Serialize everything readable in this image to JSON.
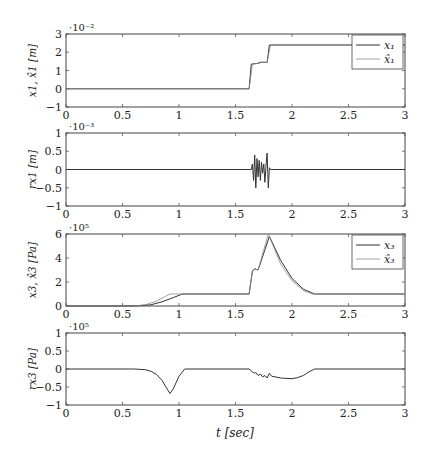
{
  "figure": {
    "xlabel": "t [sec]",
    "x_ticks": [
      "0",
      "0.5",
      "1",
      "1.5",
      "2",
      "2.5",
      "3"
    ],
    "colors": {
      "axis": "#444444",
      "series_dark": "#333333",
      "series_light": "#8a8a8a"
    }
  },
  "chart_data": [
    {
      "type": "line",
      "title": "",
      "ylabel": "x1, x̂1 [m]",
      "ylabel_main": "x",
      "ylabel_sub": "1",
      "ylabel_tail": ", x̂₁ [m]",
      "exponent": "·10⁻²",
      "xlim": [
        0,
        3
      ],
      "ylim": [
        -1,
        3
      ],
      "y_ticks": [
        "3",
        "2",
        "1",
        "0",
        "−1"
      ],
      "legend_position": "upper right",
      "series": [
        {
          "name": "x1",
          "legend": "x₁",
          "x": [
            0,
            1.62,
            1.64,
            1.71,
            1.71,
            1.78,
            1.8,
            3
          ],
          "values": [
            0,
            0,
            1.35,
            1.4,
            1.45,
            1.45,
            2.4,
            2.4
          ]
        },
        {
          "name": "x̂1",
          "legend": "x̂₁",
          "x": [
            0,
            1.62,
            1.65,
            1.71,
            1.72,
            1.78,
            1.81,
            3
          ],
          "values": [
            0,
            0,
            1.35,
            1.4,
            1.45,
            1.45,
            2.4,
            2.4
          ]
        }
      ]
    },
    {
      "type": "line",
      "title": "",
      "ylabel": "rx1 [m]",
      "exponent": "·10⁻³",
      "xlim": [
        0,
        3
      ],
      "ylim": [
        -1,
        1
      ],
      "y_ticks": [
        "1",
        "0.5",
        "0",
        "−0.5",
        "−1"
      ],
      "series": [
        {
          "name": "rx1",
          "x": [
            0,
            1.64,
            1.65,
            1.66,
            1.67,
            1.68,
            1.69,
            1.7,
            1.71,
            1.72,
            1.73,
            1.74,
            1.75,
            1.76,
            1.77,
            1.78,
            1.79,
            1.8,
            1.81,
            3
          ],
          "values": [
            0,
            0,
            0.15,
            -0.3,
            0.4,
            -0.5,
            0.3,
            -0.2,
            0.25,
            -0.3,
            0.2,
            -0.1,
            0.15,
            -0.35,
            0.1,
            0.45,
            -0.5,
            0.05,
            0,
            0
          ]
        }
      ]
    },
    {
      "type": "line",
      "title": "",
      "ylabel": "x3, x̂3 [Pa]",
      "exponent": "·10⁵",
      "xlim": [
        0,
        3
      ],
      "ylim": [
        0,
        6
      ],
      "y_ticks": [
        "6",
        "4",
        "2",
        "0"
      ],
      "legend_position": "upper right",
      "series": [
        {
          "name": "x3",
          "legend": "x₃",
          "x": [
            0,
            0.6,
            0.75,
            0.85,
            0.95,
            1.03,
            1.62,
            1.65,
            1.67,
            1.7,
            1.8,
            1.9,
            2.0,
            2.1,
            2.2,
            3
          ],
          "values": [
            0,
            0,
            0.1,
            0.35,
            0.7,
            1.0,
            1.0,
            2.9,
            3.1,
            3.0,
            5.8,
            3.8,
            2.3,
            1.4,
            1.0,
            1.0
          ]
        },
        {
          "name": "x̂3",
          "legend": "x̂₃",
          "x": [
            0,
            0.6,
            0.7,
            0.8,
            0.88,
            0.92,
            1.62,
            1.65,
            1.67,
            1.7,
            1.79,
            1.9,
            2.0,
            2.1,
            2.18,
            3
          ],
          "values": [
            0,
            0,
            0.1,
            0.4,
            0.8,
            1.0,
            1.0,
            2.9,
            3.1,
            3.0,
            6.0,
            3.5,
            2.1,
            1.3,
            1.0,
            1.0
          ]
        }
      ]
    },
    {
      "type": "line",
      "title": "",
      "ylabel": "rx3 [Pa]",
      "exponent": "·10⁵",
      "xlim": [
        0,
        3
      ],
      "ylim": [
        -1,
        1
      ],
      "y_ticks": [
        "1",
        "0.5",
        "0",
        "−0.5",
        "−1"
      ],
      "series": [
        {
          "name": "rx3",
          "x": [
            0,
            0.6,
            0.7,
            0.75,
            0.8,
            0.85,
            0.9,
            0.92,
            0.95,
            1.0,
            1.05,
            1.62,
            1.65,
            1.67,
            1.68,
            1.7,
            1.72,
            1.74,
            1.76,
            1.78,
            1.8,
            1.82,
            1.9,
            2.0,
            2.05,
            2.1,
            2.15,
            2.2,
            3
          ],
          "values": [
            0,
            0,
            -0.02,
            -0.06,
            -0.15,
            -0.32,
            -0.58,
            -0.68,
            -0.55,
            -0.2,
            0,
            0,
            -0.08,
            -0.12,
            -0.1,
            -0.18,
            -0.14,
            -0.22,
            -0.18,
            -0.25,
            -0.12,
            -0.2,
            -0.25,
            -0.27,
            -0.24,
            -0.18,
            -0.08,
            0,
            0
          ]
        }
      ]
    }
  ]
}
